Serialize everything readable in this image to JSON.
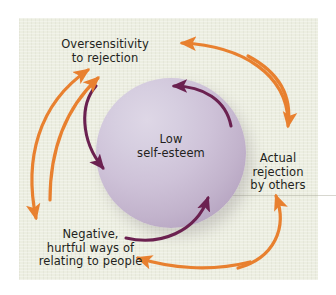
{
  "figure": {
    "center_label": {
      "line1": "Low",
      "line2": "self-esteem"
    },
    "nodes": [
      {
        "id": "oversensitivity",
        "line1": "Oversensitivity",
        "line2": "to rejection"
      },
      {
        "id": "actual-rejection",
        "line1": "Actual",
        "line2": "rejection",
        "line3": "by others"
      },
      {
        "id": "negative-ways",
        "line1": "Negative,",
        "line2": "hurtful ways of",
        "line3": "relating to people"
      }
    ],
    "colors": {
      "background": "#ffffff",
      "panel": "#eceee1",
      "sphere_light": "#ded7e6",
      "sphere_dark": "#ab97b6",
      "outer_arrow": "#e8802f",
      "inner_arrow": "#6b2150",
      "text": "#231f20"
    }
  }
}
